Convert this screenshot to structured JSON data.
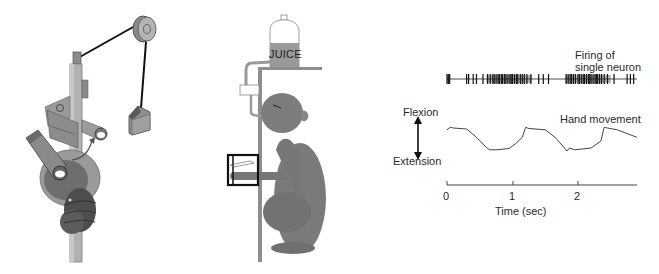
{
  "figure": {
    "panels": [
      {
        "id": "apparatus",
        "description": "Manipulandum with pulley and weight, hand grasping rotating handle"
      },
      {
        "id": "monkey",
        "description": "Monkey seated with hand in manipulandum box, receiving juice reward"
      },
      {
        "id": "trace",
        "description": "Single neuron firing raster and hand movement trace over time"
      }
    ],
    "monkey_panel": {
      "bottle_label": "JUICE"
    },
    "trace_panel": {
      "spike_label_line1": "Firing of",
      "spike_label_line2": "single neuron",
      "movement_label": "Hand movement",
      "flexion_label": "Flexion",
      "extension_label": "Extension",
      "x_axis_label": "Time (sec)",
      "x_ticks": [
        "0",
        "1",
        "2"
      ]
    }
  },
  "chart_data": {
    "type": "line",
    "title": "",
    "xlabel": "Time (sec)",
    "ylabel": "Flexion ↔ Extension",
    "x_ticks": [
      0,
      1,
      2
    ],
    "xlim": [
      0,
      2.9
    ],
    "series": [
      {
        "name": "Hand movement",
        "x": [
          0.0,
          0.05,
          0.1,
          0.3,
          0.45,
          0.6,
          0.65,
          0.75,
          0.95,
          1.05,
          1.15,
          1.2,
          1.25,
          1.5,
          1.65,
          1.8,
          1.83,
          1.87,
          1.95,
          2.2,
          2.35,
          2.4,
          2.45,
          2.6,
          2.9
        ],
        "values": [
          0.85,
          0.95,
          0.92,
          0.88,
          0.55,
          0.15,
          0.05,
          0.05,
          0.1,
          0.3,
          0.55,
          0.95,
          0.9,
          0.85,
          0.55,
          0.1,
          0.0,
          0.12,
          0.05,
          0.12,
          0.4,
          0.95,
          0.92,
          0.85,
          0.55
        ]
      }
    ],
    "spike_raster": {
      "name": "Firing of single neuron",
      "burst_regions_sec": [
        [
          0.0,
          0.05
        ],
        [
          0.6,
          1.3
        ],
        [
          1.8,
          2.5
        ]
      ],
      "spike_times_sec": [
        0.0,
        0.02,
        0.04,
        0.3,
        0.33,
        0.4,
        0.45,
        0.55,
        0.62,
        0.66,
        0.7,
        0.72,
        0.75,
        0.78,
        0.8,
        0.83,
        0.85,
        0.88,
        0.9,
        0.93,
        0.96,
        0.98,
        1.0,
        1.03,
        1.06,
        1.08,
        1.12,
        1.15,
        1.18,
        1.22,
        1.28,
        1.4,
        1.47,
        1.55,
        1.82,
        1.85,
        1.88,
        1.9,
        1.93,
        1.96,
        2.0,
        2.02,
        2.05,
        2.08,
        2.1,
        2.13,
        2.16,
        2.18,
        2.2,
        2.23,
        2.26,
        2.28,
        2.3,
        2.33,
        2.36,
        2.4,
        2.45,
        2.55,
        2.75,
        2.8,
        2.85
      ]
    }
  }
}
